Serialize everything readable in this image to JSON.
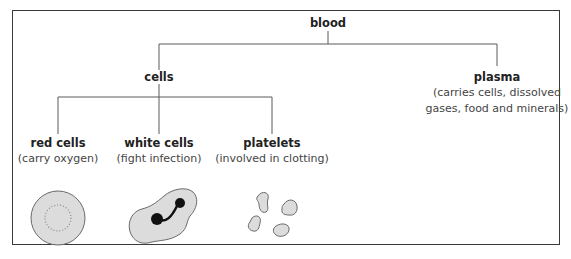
{
  "diagram": {
    "type": "tree",
    "root": {
      "label": "blood"
    },
    "nodes": {
      "cells": {
        "label": "cells"
      },
      "plasma": {
        "label": "plasma",
        "desc_line1": "(carries cells, dissolved",
        "desc_line2": "gases, food and minerals)"
      },
      "red_cells": {
        "label": "red cells",
        "desc": "(carry oxygen)"
      },
      "white_cells": {
        "label": "white cells",
        "desc": "(fight infection)"
      },
      "platelets": {
        "label": "platelets",
        "desc": "(involved in clotting)"
      }
    },
    "edges": [
      [
        "blood",
        "cells"
      ],
      [
        "blood",
        "plasma"
      ],
      [
        "cells",
        "red_cells"
      ],
      [
        "cells",
        "white_cells"
      ],
      [
        "cells",
        "platelets"
      ]
    ],
    "illustrations": {
      "red_cells": "red-blood-cell-disc",
      "white_cells": "white-blood-cell-with-nucleus",
      "platelets": "platelet-fragments"
    },
    "colors": {
      "line": "#5a5a5a",
      "cell_fill": "#dcdcdc",
      "cell_stroke": "#6a6a6a",
      "nucleus": "#111111"
    }
  }
}
